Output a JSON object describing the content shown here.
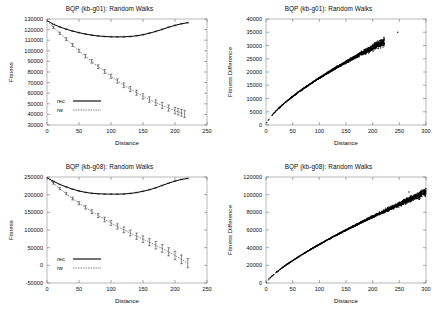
{
  "figure": {
    "background": "#ffffff",
    "panel_count": 4
  },
  "panels": [
    {
      "id": "panel-tl",
      "title": "BQP (kb-g01): Random Walks",
      "xlabel": "Distance",
      "ylabel": "Fitness"
    },
    {
      "id": "panel-tr",
      "title": "BQP (kb-g01): Random Walks",
      "xlabel": "Distance",
      "ylabel": "Fitness Difference"
    },
    {
      "id": "panel-bl",
      "title": "BQP (kb-g08): Random Walks",
      "xlabel": "Distance",
      "ylabel": "Fitness"
    },
    {
      "id": "panel-br",
      "title": "BQP (kb-g08): Random Walks",
      "xlabel": "Distance",
      "ylabel": "Fitness Difference"
    }
  ],
  "legend": {
    "rec_label": "rec",
    "rw_label": "rw"
  },
  "chart_data": [
    {
      "panel": "panel-tl",
      "type": "line",
      "title": "BQP (kb-g01): Random Walks",
      "xlabel": "Distance",
      "ylabel": "Fitness",
      "xlim": [
        0,
        250
      ],
      "ylim": [
        30000,
        130000
      ],
      "xticks": [
        0,
        50,
        100,
        150,
        200,
        250
      ],
      "yticks": [
        30000,
        40000,
        50000,
        60000,
        70000,
        80000,
        90000,
        100000,
        110000,
        120000,
        130000
      ],
      "grid": false,
      "legend_position": "lower-left",
      "errorbars": true,
      "series": [
        {
          "name": "rec",
          "style": "solid",
          "color": "#000000",
          "x": [
            0,
            10,
            20,
            30,
            40,
            50,
            60,
            70,
            80,
            90,
            100,
            110,
            120,
            130,
            140,
            150,
            160,
            170,
            180,
            190,
            200,
            210,
            220
          ],
          "values": [
            128500,
            125000,
            122500,
            120400,
            118600,
            117100,
            115800,
            114800,
            114000,
            113500,
            113200,
            113100,
            113200,
            113500,
            114200,
            115200,
            116600,
            118300,
            120200,
            122200,
            124000,
            125500,
            126500
          ],
          "yerr": [
            0,
            300,
            350,
            400,
            400,
            400,
            400,
            400,
            400,
            400,
            400,
            400,
            400,
            400,
            400,
            400,
            400,
            400,
            400,
            400,
            400,
            400,
            400
          ]
        },
        {
          "name": "rw",
          "style": "dashed",
          "color": "#2b2b2b",
          "x": [
            0,
            10,
            20,
            30,
            40,
            50,
            60,
            70,
            80,
            90,
            100,
            110,
            120,
            130,
            140,
            150,
            160,
            170,
            180,
            190,
            200,
            205,
            210,
            215
          ],
          "values": [
            128500,
            122000,
            116500,
            111000,
            105500,
            100000,
            95000,
            90000,
            85000,
            80500,
            76000,
            71500,
            67500,
            64000,
            60500,
            57000,
            54000,
            51000,
            48500,
            46000,
            43500,
            42500,
            41500,
            40500
          ],
          "yerr": [
            0,
            900,
            1100,
            1300,
            1400,
            1500,
            1600,
            1700,
            1800,
            1900,
            2000,
            2100,
            2200,
            2300,
            2400,
            2500,
            2600,
            2700,
            2800,
            2900,
            3000,
            3100,
            3200,
            3300
          ]
        }
      ]
    },
    {
      "panel": "panel-tr",
      "type": "scatter",
      "title": "BQP (kb-g01): Random Walks",
      "xlabel": "Distance",
      "ylabel": "Fitness Difference",
      "xlim": [
        0,
        300
      ],
      "ylim": [
        0,
        40000
      ],
      "xticks": [
        0,
        50,
        100,
        150,
        200,
        250,
        300
      ],
      "yticks": [
        0,
        5000,
        10000,
        15000,
        20000,
        25000,
        30000,
        35000,
        40000
      ],
      "grid": false,
      "description": "Dense concave cloud rising from origin, widening after x=150; isolated outlier near (247, 35000)",
      "cloud": {
        "x_start": 0,
        "x_end": 222,
        "curve_exponent": 0.72,
        "y_at_xend": 31500,
        "spread_base": 180,
        "spread_growth": 2100,
        "point_count": 1700
      },
      "outliers": [
        {
          "x": 247,
          "y": 35000
        },
        {
          "x": 221,
          "y": 33100
        }
      ]
    },
    {
      "panel": "panel-bl",
      "type": "line",
      "title": "BQP (kb-g08): Random Walks",
      "xlabel": "Distance",
      "ylabel": "Fitness",
      "xlim": [
        0,
        250
      ],
      "ylim": [
        -50000,
        250000
      ],
      "xticks": [
        0,
        50,
        100,
        150,
        200,
        250
      ],
      "yticks": [
        -50000,
        0,
        50000,
        100000,
        150000,
        200000,
        250000
      ],
      "grid": false,
      "legend_position": "lower-left",
      "errorbars": true,
      "series": [
        {
          "name": "rec",
          "style": "solid",
          "color": "#000000",
          "x": [
            0,
            10,
            20,
            30,
            40,
            50,
            60,
            70,
            80,
            90,
            100,
            110,
            120,
            130,
            140,
            150,
            160,
            170,
            180,
            190,
            200,
            210,
            220
          ],
          "values": [
            248000,
            238000,
            229000,
            222000,
            215500,
            210500,
            206500,
            204000,
            202500,
            201800,
            201500,
            201500,
            202000,
            203500,
            206000,
            209500,
            214000,
            219500,
            226000,
            232500,
            238500,
            243000,
            246000
          ],
          "yerr": [
            0,
            700,
            800,
            900,
            900,
            900,
            900,
            900,
            900,
            900,
            900,
            900,
            900,
            900,
            900,
            900,
            900,
            900,
            900,
            900,
            900,
            900,
            900
          ]
        },
        {
          "name": "rw",
          "style": "dashed",
          "color": "#2b2b2b",
          "x": [
            0,
            10,
            20,
            30,
            40,
            50,
            60,
            70,
            80,
            90,
            100,
            110,
            120,
            130,
            140,
            150,
            160,
            170,
            180,
            190,
            200,
            210,
            220
          ],
          "values": [
            248000,
            232000,
            217000,
            203000,
            189000,
            176000,
            164000,
            152000,
            141000,
            130000,
            120000,
            110000,
            100500,
            91500,
            82500,
            74000,
            65500,
            57000,
            48000,
            38500,
            28000,
            17000,
            6000
          ],
          "yerr": [
            0,
            2500,
            3000,
            3500,
            4000,
            4500,
            5000,
            5500,
            6000,
            6500,
            7000,
            7500,
            8000,
            8500,
            9000,
            9500,
            10000,
            10500,
            11000,
            11500,
            12000,
            12500,
            13000
          ]
        }
      ]
    },
    {
      "panel": "panel-br",
      "type": "scatter",
      "title": "BQP (kb-g08): Random Walks",
      "xlabel": "Distance",
      "ylabel": "Fitness Difference",
      "xlim": [
        0,
        300
      ],
      "ylim": [
        0,
        120000
      ],
      "xticks": [
        0,
        50,
        100,
        150,
        200,
        250,
        300
      ],
      "yticks": [
        0,
        20000,
        40000,
        60000,
        80000,
        100000,
        120000
      ],
      "grid": false,
      "description": "Dense concave cloud rising from origin to about 105000 at x=300, widening after x=180",
      "cloud": {
        "x_start": 0,
        "x_end": 300,
        "curve_exponent": 0.78,
        "y_at_xend": 103000,
        "spread_base": 400,
        "spread_growth": 6200,
        "point_count": 1900
      },
      "outliers": [
        {
          "x": 289,
          "y": 99000
        },
        {
          "x": 300,
          "y": 106500
        },
        {
          "x": 268,
          "y": 103000
        },
        {
          "x": 283,
          "y": 96000
        }
      ]
    }
  ]
}
